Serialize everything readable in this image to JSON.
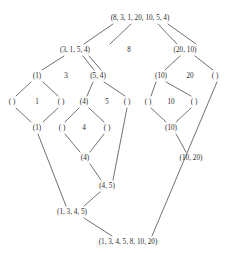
{
  "diagram": {
    "stroke_color": "#4d4d4d",
    "text_color": "#2b2b2b",
    "background": "#ffffff",
    "nodes": [
      {
        "id": "root",
        "label": "(8, 3, 1, 20, 10, 5, 4)",
        "x": 140,
        "y": 18
      },
      {
        "id": "l2a",
        "label": "(3, 1, 5, 4)",
        "x": 75,
        "y": 50
      },
      {
        "id": "l2b",
        "label": "8",
        "x": 129,
        "y": 50
      },
      {
        "id": "l2c",
        "label": "(20, 10)",
        "x": 185,
        "y": 50
      },
      {
        "id": "l3a",
        "label": "(1)",
        "x": 37,
        "y": 76
      },
      {
        "id": "l3b",
        "label": "3",
        "x": 66,
        "y": 76
      },
      {
        "id": "l3c",
        "label": "(5, 4)",
        "x": 98,
        "y": 76
      },
      {
        "id": "l3d",
        "label": "(10)",
        "x": 161,
        "y": 76
      },
      {
        "id": "l3e",
        "label": "20",
        "x": 190,
        "y": 76
      },
      {
        "id": "l3f",
        "label": "( )",
        "x": 215,
        "y": 76
      },
      {
        "id": "l4a",
        "label": "( )",
        "x": 12,
        "y": 102
      },
      {
        "id": "l4b",
        "label": "1",
        "x": 37,
        "y": 102
      },
      {
        "id": "l4c",
        "label": "( )",
        "x": 61,
        "y": 102
      },
      {
        "id": "l4d",
        "label": "(4)",
        "x": 84,
        "y": 102
      },
      {
        "id": "l4e",
        "label": "5",
        "x": 107,
        "y": 102
      },
      {
        "id": "l4f",
        "label": "( )",
        "x": 127,
        "y": 102
      },
      {
        "id": "l4g",
        "label": "( )",
        "x": 148,
        "y": 102
      },
      {
        "id": "l4h",
        "label": "10",
        "x": 171,
        "y": 102
      },
      {
        "id": "l4i",
        "label": "( )",
        "x": 194,
        "y": 102
      },
      {
        "id": "l5a",
        "label": "(1)",
        "x": 37,
        "y": 128
      },
      {
        "id": "l5b",
        "label": "( )",
        "x": 62,
        "y": 128
      },
      {
        "id": "l5c",
        "label": "4",
        "x": 84,
        "y": 128
      },
      {
        "id": "l5d",
        "label": "( )",
        "x": 107,
        "y": 128
      },
      {
        "id": "l5e",
        "label": "(10)",
        "x": 171,
        "y": 128
      },
      {
        "id": "l6a",
        "label": "(4)",
        "x": 85,
        "y": 158
      },
      {
        "id": "l6b",
        "label": "(10, 20)",
        "x": 191,
        "y": 158
      },
      {
        "id": "l7a",
        "label": "(4, 5)",
        "x": 107,
        "y": 186
      },
      {
        "id": "l8a",
        "label": "(1, 3, 4, 5)",
        "x": 72,
        "y": 212
      },
      {
        "id": "bottom",
        "label": "(1, 3, 4, 5, 8, 10, 20)",
        "x": 128,
        "y": 242
      }
    ],
    "edges": [
      {
        "from": "root",
        "to": "l2a"
      },
      {
        "from": "root",
        "to": "l2b"
      },
      {
        "from": "root",
        "to": "l2c"
      },
      {
        "from": "root",
        "to": "l2c-alt"
      },
      {
        "from": "l2a",
        "to": "l3a"
      },
      {
        "from": "l2a",
        "to": "l3b"
      },
      {
        "from": "l2a",
        "to": "l3c"
      },
      {
        "from": "l2c",
        "to": "l3d"
      },
      {
        "from": "l2c",
        "to": "l3f"
      },
      {
        "from": "l3a",
        "to": "l4a"
      },
      {
        "from": "l3a",
        "to": "l4c"
      },
      {
        "from": "l3c",
        "to": "l4d"
      },
      {
        "from": "l3c",
        "to": "l4f"
      },
      {
        "from": "l3d",
        "to": "l4g"
      },
      {
        "from": "l3d",
        "to": "l4i"
      },
      {
        "from": "l4a",
        "to": "l5a"
      },
      {
        "from": "l4c",
        "to": "l5a"
      },
      {
        "from": "l4d",
        "to": "l5b"
      },
      {
        "from": "l4d",
        "to": "l5d"
      },
      {
        "from": "l4g",
        "to": "l5e"
      },
      {
        "from": "l4i",
        "to": "l5e"
      },
      {
        "from": "l5b",
        "to": "l6a"
      },
      {
        "from": "l5d",
        "to": "l6a"
      },
      {
        "from": "l5e",
        "to": "l6b"
      },
      {
        "from": "l6a",
        "to": "l7a"
      },
      {
        "from": "l4f",
        "to": "l7a"
      },
      {
        "from": "l5a",
        "to": "l8a"
      },
      {
        "from": "l7a",
        "to": "l8a"
      },
      {
        "from": "l8a",
        "to": "bottom"
      },
      {
        "from": "l3f",
        "to": "bottom"
      }
    ]
  }
}
